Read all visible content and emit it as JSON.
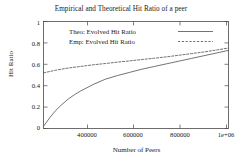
{
  "chart_data": {
    "type": "line",
    "title": "Empirical and Theoretical Hit Ratio of a peer",
    "xlabel": "Number of Peers",
    "ylabel": "Hit Ratio",
    "xlim": [
      250000,
      1000000
    ],
    "ylim": [
      0,
      1
    ],
    "grid": false,
    "legend_position": "top-left-inside",
    "xticks": [
      400000,
      600000,
      800000,
      1000000
    ],
    "xtick_labels": [
      "400000",
      "600000",
      "800000",
      "1e+06"
    ],
    "yticks": [
      0,
      0.2,
      0.4,
      0.6,
      0.8,
      1
    ],
    "ytick_labels": [
      "0",
      "0.2",
      "0.4",
      "0.6",
      "0.8",
      "1"
    ],
    "series": [
      {
        "name": "Theo: Evolved Hit Ratio",
        "style": "solid",
        "color": "#5a5a5a",
        "x": [
          250000,
          275000,
          300000,
          325000,
          350000,
          375000,
          400000,
          450000,
          500000,
          550000,
          600000,
          650000,
          700000,
          750000,
          800000,
          850000,
          900000,
          950000,
          1000000
        ],
        "y": [
          0.02,
          0.1,
          0.17,
          0.225,
          0.275,
          0.315,
          0.35,
          0.41,
          0.46,
          0.495,
          0.525,
          0.555,
          0.58,
          0.605,
          0.63,
          0.655,
          0.68,
          0.705,
          0.73
        ]
      },
      {
        "name": "Emp: Evolved Hit Ratio",
        "style": "dashed",
        "color": "#5a5a5a",
        "x": [
          250000,
          300000,
          350000,
          400000,
          450000,
          500000,
          550000,
          600000,
          650000,
          700000,
          750000,
          800000,
          850000,
          900000,
          950000,
          1000000
        ],
        "y": [
          0.52,
          0.545,
          0.565,
          0.58,
          0.595,
          0.607,
          0.62,
          0.632,
          0.645,
          0.657,
          0.67,
          0.685,
          0.7,
          0.715,
          0.733,
          0.752
        ]
      }
    ]
  },
  "legend": {
    "entries": [
      {
        "label": "Theo: Evolved Hit Ratio",
        "style": "solid"
      },
      {
        "label": "Emp: Evolved Hit Ratio",
        "style": "dashed"
      }
    ]
  }
}
